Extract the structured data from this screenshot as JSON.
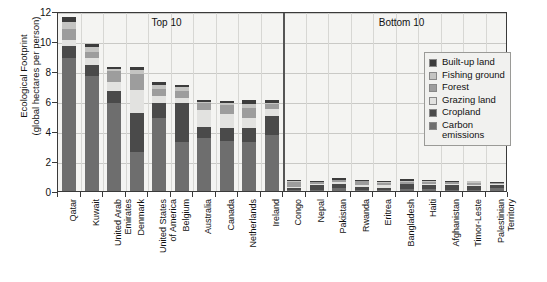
{
  "chart_data": {
    "type": "bar",
    "subtype": "stacked-bar",
    "title": "",
    "xlabel": "",
    "ylabel": "Ecological Footprint\n(global hectares per person)",
    "ylim": [
      0,
      12
    ],
    "yticks": [
      0,
      2,
      4,
      6,
      8,
      10,
      12
    ],
    "grid": true,
    "legend_position": "right-inside",
    "annotations": [
      {
        "text": "Top 10",
        "x_category_range": [
          "Qatar",
          "Ireland"
        ]
      },
      {
        "text": "Bottom 10",
        "x_category_range": [
          "Congo",
          "Palestinian Territory"
        ]
      }
    ],
    "group_divider_after": "Ireland",
    "categories": [
      "Qatar",
      "Kuwait",
      "United Arab\nEmirates",
      "Denmark",
      "United States\nof America",
      "Belgium",
      "Australia",
      "Canada",
      "Netherlands",
      "Ireland",
      "Congo",
      "Nepal",
      "Pakistan",
      "Rwanda",
      "Eritrea",
      "Bangladesh",
      "Haiti",
      "Afghanistan",
      "Timor-Leste",
      "Palestinian\nTerritory"
    ],
    "series": [
      {
        "name": "Carbon emissions",
        "color": "#6e6e6e",
        "values": [
          8.85,
          7.7,
          5.9,
          2.6,
          4.85,
          3.25,
          3.55,
          3.35,
          3.3,
          3.75,
          0.08,
          0.05,
          0.18,
          0.05,
          0.05,
          0.15,
          0.12,
          0.07,
          0.1,
          0.22
        ]
      },
      {
        "name": "Cropland",
        "color": "#4a4a4a",
        "values": [
          0.85,
          0.72,
          0.8,
          2.6,
          1.0,
          2.6,
          0.75,
          0.85,
          0.9,
          1.25,
          0.12,
          0.32,
          0.32,
          0.22,
          0.14,
          0.3,
          0.3,
          0.3,
          0.22,
          0.18
        ]
      },
      {
        "name": "Grazing land",
        "color": "#e2e2e0",
        "values": [
          0.35,
          0.45,
          0.6,
          1.55,
          0.5,
          0.38,
          1.1,
          0.95,
          0.65,
          0.45,
          0.06,
          0.07,
          0.12,
          0.16,
          0.24,
          0.05,
          0.06,
          0.12,
          0.09,
          0.05
        ]
      },
      {
        "name": "Forest",
        "color": "#9d9d9d",
        "values": [
          0.75,
          0.4,
          0.68,
          1.05,
          0.45,
          0.45,
          0.45,
          0.6,
          0.7,
          0.35,
          0.36,
          0.14,
          0.1,
          0.22,
          0.1,
          0.1,
          0.12,
          0.1,
          0.12,
          0.08
        ]
      },
      {
        "name": "Fishing ground",
        "color": "#c4c4c2",
        "values": [
          0.5,
          0.3,
          0.15,
          0.25,
          0.3,
          0.25,
          0.1,
          0.12,
          0.25,
          0.1,
          0.04,
          0.02,
          0.02,
          0.02,
          0.1,
          0.1,
          0.1,
          0.02,
          0.12,
          0.03
        ]
      },
      {
        "name": "Built-up land",
        "color": "#3c3c3c",
        "values": [
          0.3,
          0.25,
          0.15,
          0.2,
          0.15,
          0.15,
          0.1,
          0.15,
          0.25,
          0.15,
          0.06,
          0.06,
          0.1,
          0.05,
          0.04,
          0.12,
          0.05,
          0.04,
          0.05,
          0.06
        ]
      }
    ],
    "legend_order": [
      "Built-up land",
      "Fishing ground",
      "Forest",
      "Grazing land",
      "Cropland",
      "Carbon\nemissions"
    ]
  }
}
